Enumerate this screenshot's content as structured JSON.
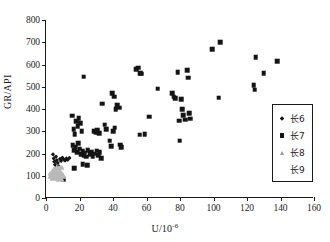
{
  "chart_data": {
    "type": "scatter",
    "title": "",
    "xlabel": "U/10",
    "xlabel_sup": "-6",
    "ylabel": "GR/API",
    "xlim": [
      0,
      160
    ],
    "ylim": [
      0,
      800
    ],
    "xticks": [
      0,
      20,
      40,
      60,
      80,
      100,
      120,
      140,
      160
    ],
    "yticks": [
      0,
      100,
      200,
      300,
      400,
      500,
      600,
      700,
      800
    ],
    "grid": false,
    "legend_position": "right",
    "series": [
      {
        "name": "长6",
        "marker": "diamond",
        "color": "#141414",
        "points": [
          [
            4.2,
            196
          ],
          [
            4.6,
            178
          ],
          [
            5.0,
            163
          ],
          [
            5.4,
            150
          ],
          [
            6.0,
            186
          ],
          [
            6.4,
            170
          ],
          [
            7.0,
            158
          ],
          [
            7.6,
            143
          ],
          [
            8.4,
            175
          ],
          [
            9.0,
            166
          ],
          [
            9.8,
            181
          ],
          [
            10.6,
            173
          ],
          [
            11.4,
            168
          ],
          [
            12.2,
            178
          ],
          [
            13.0,
            172
          ],
          [
            14.0,
            180
          ],
          [
            5.8,
            134
          ],
          [
            7.2,
            128
          ]
        ]
      },
      {
        "name": "长7",
        "marker": "square",
        "color": "#141414",
        "points": [
          [
            9.5,
            86
          ],
          [
            10.5,
            84
          ],
          [
            15.5,
            370
          ],
          [
            16.5,
            310
          ],
          [
            17.2,
            287
          ],
          [
            18.0,
            345
          ],
          [
            19.0,
            322
          ],
          [
            19.6,
            358
          ],
          [
            20.4,
            336
          ],
          [
            21.2,
            300
          ],
          [
            22.6,
            546
          ],
          [
            16.0,
            236
          ],
          [
            17.0,
            214
          ],
          [
            17.8,
            228
          ],
          [
            18.6,
            205
          ],
          [
            19.4,
            246
          ],
          [
            20.2,
            222
          ],
          [
            21.0,
            198
          ],
          [
            21.8,
            210
          ],
          [
            22.4,
            190
          ],
          [
            23.2,
            203
          ],
          [
            24.0,
            186
          ],
          [
            25.0,
            215
          ],
          [
            26.0,
            196
          ],
          [
            27.0,
            205
          ],
          [
            28.0,
            188
          ],
          [
            29.0,
            200
          ],
          [
            30.2,
            212
          ],
          [
            31.0,
            193
          ],
          [
            32.0,
            206
          ],
          [
            33.0,
            180
          ],
          [
            16.8,
            133
          ],
          [
            22.0,
            152
          ],
          [
            24.6,
            148
          ],
          [
            28.6,
            300
          ],
          [
            29.6,
            296
          ],
          [
            30.6,
            304
          ],
          [
            31.6,
            292
          ],
          [
            33.4,
            424
          ],
          [
            35.0,
            330
          ],
          [
            36.0,
            310
          ],
          [
            38.0,
            258
          ],
          [
            39.0,
            232
          ],
          [
            40.0,
            300
          ],
          [
            41.0,
            316
          ],
          [
            39.6,
            472
          ],
          [
            40.6,
            455
          ],
          [
            41.6,
            400
          ],
          [
            42.6,
            418
          ],
          [
            43.6,
            406
          ],
          [
            44.2,
            240
          ],
          [
            45.0,
            228
          ],
          [
            54.0,
            580
          ],
          [
            55.2,
            586
          ],
          [
            56.4,
            560
          ],
          [
            57.0,
            558
          ],
          [
            56.0,
            284
          ],
          [
            59.0,
            288
          ],
          [
            61.6,
            366
          ],
          [
            66.8,
            492
          ],
          [
            75.2,
            470
          ],
          [
            76.2,
            455
          ],
          [
            77.0,
            448
          ],
          [
            78.6,
            566
          ],
          [
            79.4,
            348
          ],
          [
            79.8,
            258
          ],
          [
            80.6,
            443
          ],
          [
            81.4,
            398
          ],
          [
            82.0,
            372
          ],
          [
            83.0,
            352
          ],
          [
            84.2,
            574
          ],
          [
            84.8,
            540
          ],
          [
            85.4,
            380
          ],
          [
            86.0,
            356
          ],
          [
            99.4,
            670
          ],
          [
            104.0,
            700
          ],
          [
            103.0,
            450
          ],
          [
            124.0,
            506
          ],
          [
            124.6,
            487
          ],
          [
            125.2,
            632
          ],
          [
            130.0,
            560
          ],
          [
            138.2,
            616
          ]
        ]
      },
      {
        "name": "长8",
        "marker": "triangle",
        "color": "#b9b9b9",
        "points": [
          [
            3.4,
            104
          ],
          [
            3.8,
            120
          ],
          [
            4.2,
            112
          ],
          [
            4.6,
            96
          ],
          [
            5.0,
            128
          ],
          [
            5.4,
            108
          ],
          [
            5.8,
            140
          ],
          [
            6.2,
            118
          ],
          [
            6.6,
            100
          ],
          [
            7.0,
            132
          ],
          [
            7.4,
            110
          ],
          [
            7.8,
            124
          ],
          [
            8.2,
            94
          ],
          [
            8.6,
            146
          ],
          [
            9.2,
            116
          ],
          [
            9.8,
            106
          ]
        ]
      },
      {
        "name": "长9",
        "marker": "none",
        "color": "#141414",
        "points": []
      }
    ]
  },
  "legend": {
    "items": [
      {
        "label": "长6",
        "marker": "diamond"
      },
      {
        "label": "长7",
        "marker": "square"
      },
      {
        "label": "长8",
        "marker": "triangle"
      },
      {
        "label": "长9",
        "marker": "none"
      }
    ]
  }
}
